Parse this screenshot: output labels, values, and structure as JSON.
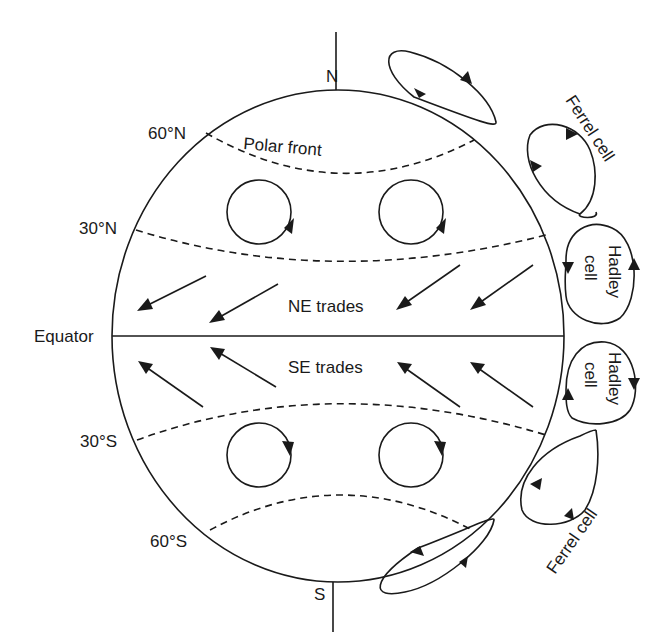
{
  "diagram": {
    "poles": {
      "north": "N",
      "south": "S"
    },
    "latitudes": {
      "n60": "60°N",
      "n30": "30°N",
      "equator": "Equator",
      "s30": "30°S",
      "s60": "60°S"
    },
    "labels": {
      "polar_front": "Polar front",
      "ne_trades": "NE trades",
      "se_trades": "SE trades",
      "ferrel_north": "Ferrel cell",
      "ferrel_south": "Ferrel cell",
      "hadley_north_1": "Hadley",
      "hadley_north_2": "cell",
      "hadley_south_1": "Hadley",
      "hadley_south_2": "cell"
    },
    "colors": {
      "ink": "#1a1a1a",
      "background": "#ffffff"
    }
  }
}
